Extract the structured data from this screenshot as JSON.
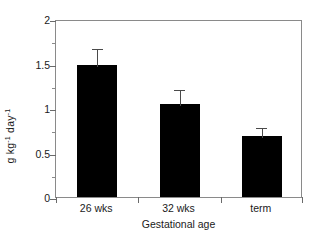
{
  "chart_data": {
    "type": "bar",
    "title": "",
    "subtitle": "",
    "xlabel": "Gestational age",
    "ylabel": "g kg⁻¹ day⁻¹",
    "ylabel_parts": [
      {
        "text": "g kg"
      },
      {
        "text": "-1",
        "sup": true
      },
      {
        "text": " day"
      },
      {
        "text": "-1",
        "sup": true
      }
    ],
    "categories": [
      "26 wks",
      "32 wks",
      "term"
    ],
    "values": [
      1.48,
      1.04,
      0.68
    ],
    "errors": [
      0.21,
      0.19,
      0.12
    ],
    "error_upper": [
      1.69,
      1.23,
      0.8
    ],
    "bar_color": "#000000",
    "errorbar_color": "#4a4a4a",
    "axis_color": "#8a8a8a",
    "ylim": [
      0,
      2
    ],
    "yticks": [
      0,
      0.5,
      1,
      1.5,
      2
    ],
    "ytick_labels": [
      "0",
      "0.5",
      "1",
      "1.5",
      "2"
    ],
    "yminor_ticks": [
      0.25,
      0.75,
      1.25,
      1.75
    ],
    "xticks_at_boundaries": true,
    "grid": false,
    "legend": false,
    "legend_position": "none",
    "frame": "box"
  }
}
